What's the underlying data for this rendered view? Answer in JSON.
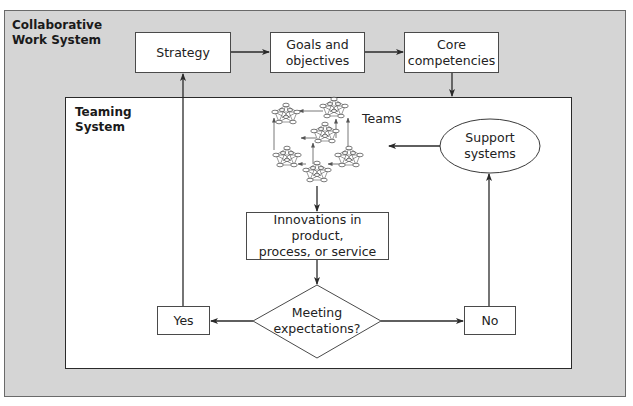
{
  "diagram": {
    "outer_system": {
      "label": "Collaborative\nWork System"
    },
    "inner_system": {
      "label": "Teaming\nSystem"
    },
    "nodes": {
      "strategy": {
        "label": "Strategy"
      },
      "goals": {
        "label": "Goals and\nobjectives"
      },
      "core": {
        "label": "Core\ncompetencies"
      },
      "teams": {
        "label": "Teams"
      },
      "support": {
        "label": "Support\nsystems"
      },
      "innovations": {
        "label": "Innovations in product,\nprocess, or service"
      },
      "decision": {
        "label": "Meeting\nexpectations?"
      },
      "yes": {
        "label": "Yes"
      },
      "no": {
        "label": "No"
      }
    },
    "edges": [
      {
        "from": "strategy",
        "to": "goals"
      },
      {
        "from": "goals",
        "to": "core"
      },
      {
        "from": "core",
        "to": "teaming-system"
      },
      {
        "from": "support",
        "to": "teams"
      },
      {
        "from": "teams",
        "to": "innovations"
      },
      {
        "from": "innovations",
        "to": "decision"
      },
      {
        "from": "decision",
        "to": "yes"
      },
      {
        "from": "decision",
        "to": "no"
      },
      {
        "from": "yes",
        "to": "strategy"
      },
      {
        "from": "no",
        "to": "support"
      }
    ],
    "colors": {
      "outer_fill": "#d5d5d5",
      "inner_fill": "#ffffff",
      "line": "#2a2a2a"
    }
  }
}
